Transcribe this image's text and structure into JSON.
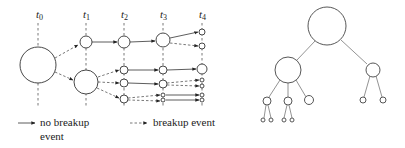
{
  "timeline": {
    "labels": [
      {
        "base": "t",
        "sub": "0"
      },
      {
        "base": "t",
        "sub": "1"
      },
      {
        "base": "t",
        "sub": "2"
      },
      {
        "base": "t",
        "sub": "3"
      },
      {
        "base": "t",
        "sub": "4"
      }
    ]
  },
  "legend": {
    "solid": {
      "line1": "no breakup",
      "line2": "event"
    },
    "dashed": {
      "line1": "breakup event"
    }
  },
  "colors": {
    "stroke": "#333333",
    "tree_edge": "#777777",
    "background": "#ffffff"
  }
}
